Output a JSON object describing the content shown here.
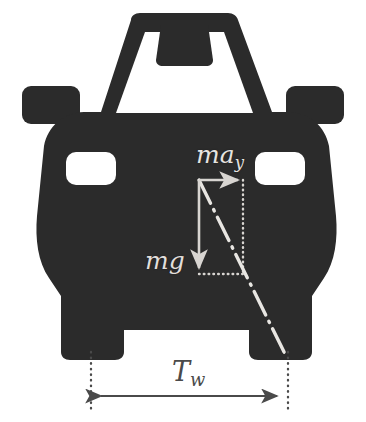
{
  "figure": {
    "background_color": "#ffffff",
    "body_color": "#2b2b2b",
    "vector_color": "#d8d5d1",
    "dimension_color": "#4a4a4a"
  },
  "labels": {
    "lateral_accel": {
      "base": "ma",
      "sub": "y"
    },
    "weight": {
      "base": "mg",
      "sub": ""
    },
    "track_width": {
      "base": "T",
      "sub": "w"
    }
  },
  "vectors": [
    {
      "name": "lateral-inertial-force",
      "label": "ma_y",
      "direction": "right",
      "from": [
        199,
        180
      ],
      "to": [
        243,
        180
      ],
      "color": "#d8d5d1"
    },
    {
      "name": "weight-force",
      "label": "mg",
      "direction": "down",
      "from": [
        199,
        180
      ],
      "to": [
        199,
        274
      ],
      "color": "#d8d5d1"
    }
  ],
  "dimension": {
    "name": "track-width",
    "label": "T_w",
    "from": [
      95,
      396
    ],
    "to": [
      283,
      396
    ],
    "arrowheads": "both",
    "extension_lines": [
      {
        "x": 91,
        "y_top": 352,
        "y_bottom": 412
      },
      {
        "x": 288,
        "y_top": 352,
        "y_bottom": 412
      }
    ],
    "color": "#4a4a4a"
  },
  "construction_lines": [
    {
      "name": "vertical-dotted-guide",
      "style": "dotted",
      "from": [
        243,
        180
      ],
      "to": [
        243,
        274
      ],
      "color": "#d8d5d1"
    },
    {
      "name": "horizontal-dotted-guide",
      "style": "dotted",
      "from": [
        199,
        274
      ],
      "to": [
        243,
        274
      ],
      "color": "#d8d5d1"
    },
    {
      "name": "cg-to-contact-patch-line",
      "style": "dash-dot",
      "from": [
        199,
        180
      ],
      "to": [
        286,
        356
      ],
      "color": "#e8e6e2"
    }
  ],
  "car": {
    "name": "car-front-silhouette",
    "color": "#2b2b2b",
    "parts": [
      "roof",
      "windshield",
      "rearview-mirror",
      "left-side-mirror",
      "right-side-mirror",
      "body",
      "left-headlight",
      "right-headlight",
      "left-wheel",
      "right-wheel"
    ]
  }
}
